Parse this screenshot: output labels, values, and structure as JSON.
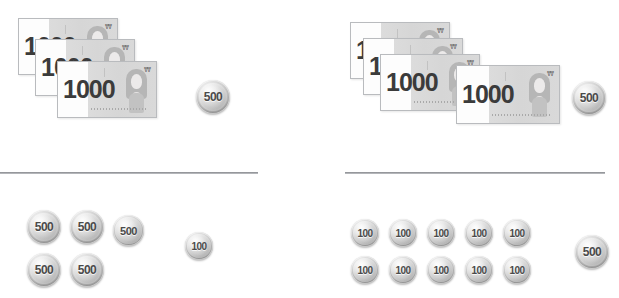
{
  "canvas": {
    "width": 619,
    "height": 298,
    "background": "#ffffff"
  },
  "currency": {
    "symbol": "₩",
    "note_value": "1000",
    "coin_500": "500",
    "coin_100": "100"
  },
  "dividers": [
    {
      "name": "divider-left",
      "x": 0,
      "y": 172,
      "width": 258
    },
    {
      "name": "divider-right",
      "x": 345,
      "y": 172,
      "width": 260
    }
  ],
  "quadrants": {
    "top_left": {
      "name": "top-left-group",
      "notes": [
        {
          "value": "1000",
          "x": 18,
          "y": 18
        },
        {
          "value": "1000",
          "x": 35,
          "y": 39
        },
        {
          "value": "1000",
          "x": 57,
          "y": 61
        }
      ],
      "coins": [
        {
          "value": "500",
          "size": "large",
          "x": 196,
          "y": 80
        }
      ],
      "note_count": 3,
      "coin_count": 1
    },
    "top_right": {
      "name": "top-right-group",
      "notes": [
        {
          "value": "1000",
          "x": 350,
          "y": 22
        },
        {
          "value": "1000",
          "x": 363,
          "y": 38
        },
        {
          "value": "1000",
          "x": 380,
          "y": 54
        },
        {
          "value": "1000",
          "x": 456,
          "y": 65
        }
      ],
      "coins": [
        {
          "value": "500",
          "size": "large",
          "x": 572,
          "y": 81
        }
      ],
      "note_count": 4,
      "coin_count": 1
    },
    "bottom_left": {
      "name": "bottom-left-group",
      "coins": [
        {
          "value": "500",
          "size": "large",
          "x": 27,
          "y": 210
        },
        {
          "value": "500",
          "size": "large",
          "x": 70,
          "y": 210
        },
        {
          "value": "500",
          "size": "small",
          "x": 113,
          "y": 215
        },
        {
          "value": "500",
          "size": "large",
          "x": 27,
          "y": 253
        },
        {
          "value": "500",
          "size": "large",
          "x": 70,
          "y": 253
        },
        {
          "value": "100",
          "size": "small",
          "x": 185,
          "y": 232
        }
      ],
      "coin_500_count": 5,
      "coin_100_count": 1
    },
    "bottom_right": {
      "name": "bottom-right-group",
      "coins": [
        {
          "value": "100",
          "size": "small",
          "x": 351,
          "y": 219
        },
        {
          "value": "100",
          "size": "small",
          "x": 389,
          "y": 219
        },
        {
          "value": "100",
          "size": "small",
          "x": 427,
          "y": 219
        },
        {
          "value": "100",
          "size": "small",
          "x": 465,
          "y": 219
        },
        {
          "value": "100",
          "size": "small",
          "x": 503,
          "y": 219
        },
        {
          "value": "100",
          "size": "small",
          "x": 351,
          "y": 256
        },
        {
          "value": "100",
          "size": "small",
          "x": 389,
          "y": 256
        },
        {
          "value": "100",
          "size": "small",
          "x": 427,
          "y": 256
        },
        {
          "value": "100",
          "size": "small",
          "x": 465,
          "y": 256
        },
        {
          "value": "100",
          "size": "small",
          "x": 503,
          "y": 256
        },
        {
          "value": "500",
          "size": "large",
          "x": 575,
          "y": 235
        }
      ],
      "coin_100_count": 10,
      "coin_500_count": 1
    }
  },
  "colors": {
    "note_paper": "#ffffff",
    "note_tint": "#d8d8d8",
    "note_text": "#3b3b3b",
    "coin_silver": "#c4c4c4",
    "coin_text": "#4a4a4a",
    "divider": "#9ea0a4"
  }
}
